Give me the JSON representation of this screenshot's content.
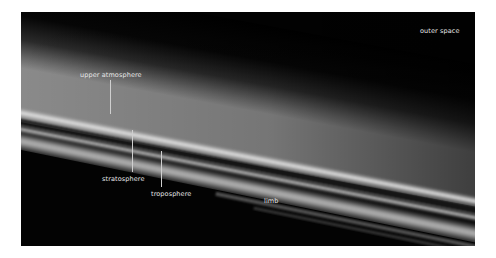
{
  "figure": {
    "labels": {
      "outer_space": "outer space",
      "upper_atmosphere": "upper atmosphere",
      "stratosphere": "stratosphere",
      "troposphere": "troposphere",
      "limb": "limb"
    }
  }
}
